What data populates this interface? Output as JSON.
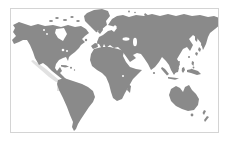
{
  "window": {
    "background_color": "#ffffff"
  },
  "map": {
    "type": "world-map-thumbnail",
    "projection": "miller-like world map, antarctica cropped",
    "land_color": "#8a8a8a",
    "ocean_color": "#ffffff",
    "frame_color": "#d4d4d4",
    "highlight_color": "#d9d9d9",
    "landmasses": [
      "north-america",
      "greenland",
      "south-america",
      "eurasia",
      "africa",
      "madagascar",
      "australia",
      "new-zealand",
      "japan",
      "indonesia",
      "philippines",
      "british-isles",
      "iceland",
      "caribbean-islands"
    ]
  }
}
